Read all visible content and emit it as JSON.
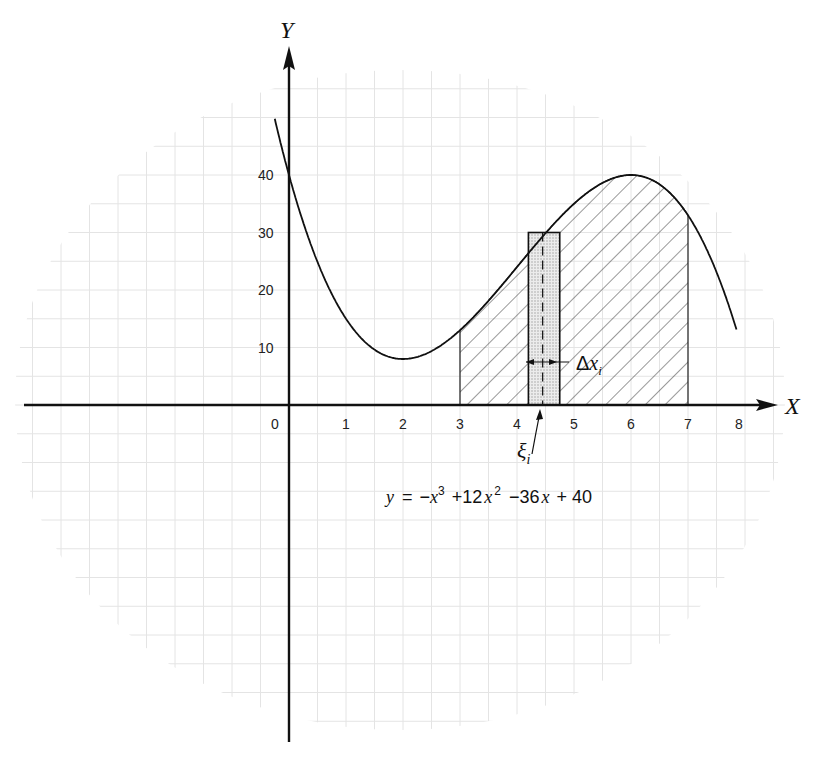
{
  "page": {
    "header_fragment": "",
    "figure_description": "Riemann-sum illustration: area under a cubic curve between x=3 and x=7 with a representative rectangle"
  },
  "chart_data": {
    "type": "line",
    "title": "",
    "equation_label": "y = −x³ + 12x² − 36x + 40",
    "function": {
      "a3": -1,
      "a2": 12,
      "a1": -36,
      "a0": 40
    },
    "xlabel": "X",
    "ylabel": "Y",
    "x_ticks": [
      "0",
      "1",
      "2",
      "3",
      "4",
      "5",
      "6",
      "7",
      "8"
    ],
    "y_ticks": [
      "10",
      "20",
      "30",
      "40"
    ],
    "xlim": [
      -4.6,
      8.6
    ],
    "ylim": [
      -58,
      62
    ],
    "grid": true,
    "curve_domain": [
      -0.25,
      7.85
    ],
    "sample_points": [
      {
        "x": 0,
        "y": 40
      },
      {
        "x": 1,
        "y": 15
      },
      {
        "x": 2,
        "y": 8
      },
      {
        "x": 3,
        "y": 13
      },
      {
        "x": 4,
        "y": 24
      },
      {
        "x": 5,
        "y": 35
      },
      {
        "x": 6,
        "y": 40
      },
      {
        "x": 7,
        "y": 33
      },
      {
        "x": 7.65,
        "y": 0
      }
    ],
    "shaded_region": {
      "x_from": 3,
      "x_to": 7,
      "pattern": "diagonal-hatch"
    },
    "riemann_rectangle": {
      "x_from": 4.2,
      "x_to": 4.75,
      "height": 30,
      "fill": "stipple"
    },
    "sample_point": {
      "x": 4.45,
      "label": "ξ",
      "subscript": "i"
    },
    "width_label": {
      "label": "Δx",
      "subscript": "i"
    },
    "annotations": [
      "ξi",
      "Δxi",
      "y = −x³ + 12x² − 36x + 40"
    ]
  },
  "labels": {
    "x_axis": "X",
    "y_axis": "Y",
    "xi": "ξ",
    "xi_sub": "i",
    "delta": "Δ",
    "delta_x": "x",
    "delta_sub": "i",
    "eq_y": "y",
    "eq_eq": "=",
    "eq_minus": "−",
    "eq_x": "x",
    "eq_3": "3",
    "eq_plus12": "+12",
    "eq_2": "2",
    "eq_minus36": "−36",
    "eq_plus40": "+ 40"
  },
  "colors": {
    "ink": "#111111",
    "grid": "#e6e6e6",
    "stipple": "#cfcfcf"
  }
}
